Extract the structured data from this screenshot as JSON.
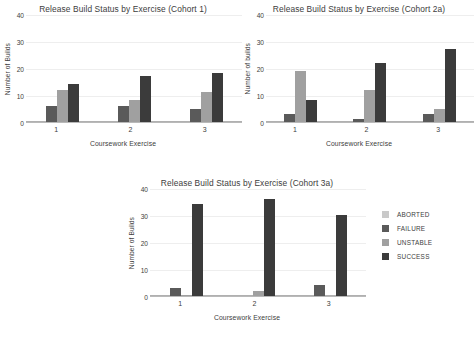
{
  "legend": {
    "items": [
      {
        "label": "ABORTED",
        "color": "#c9c9c9"
      },
      {
        "label": "FAILURE",
        "color": "#5a5a5a"
      },
      {
        "label": "UNSTABLE",
        "color": "#a0a0a0"
      },
      {
        "label": "SUCCESS",
        "color": "#3b3b3b"
      }
    ]
  },
  "chart_data": [
    {
      "type": "bar",
      "title": "Release Build Status by Exercise (Cohort 1)",
      "xlabel": "Coursework Exercise",
      "ylabel": "Number of Builds",
      "categories": [
        "1",
        "2",
        "3"
      ],
      "ylim": [
        0,
        40
      ],
      "yticks": [
        0,
        10,
        20,
        30,
        40
      ],
      "grid": true,
      "legend_position": "right-shared",
      "series": [
        {
          "name": "FAILURE",
          "color": "#5a5a5a",
          "values": [
            6,
            6,
            5
          ]
        },
        {
          "name": "UNSTABLE",
          "color": "#a0a0a0",
          "values": [
            12,
            8,
            11
          ]
        },
        {
          "name": "SUCCESS",
          "color": "#3b3b3b",
          "values": [
            14,
            17,
            18
          ]
        }
      ]
    },
    {
      "type": "bar",
      "title": "Release Build Status by Exercise (Cohort 2a)",
      "xlabel": "Coursework Exercise",
      "ylabel": "Number of builds",
      "categories": [
        "1",
        "2",
        "3"
      ],
      "ylim": [
        0,
        40
      ],
      "yticks": [
        0,
        10,
        20,
        30,
        40
      ],
      "grid": true,
      "legend_position": "right-shared",
      "series": [
        {
          "name": "FAILURE",
          "color": "#5a5a5a",
          "values": [
            3,
            1,
            3
          ]
        },
        {
          "name": "UNSTABLE",
          "color": "#a0a0a0",
          "values": [
            19,
            12,
            5
          ]
        },
        {
          "name": "SUCCESS",
          "color": "#3b3b3b",
          "values": [
            8,
            22,
            27
          ]
        }
      ]
    },
    {
      "type": "bar",
      "title": "Release Build Status by Exercise (Cohort 3a)",
      "xlabel": "Coursework Exercise",
      "ylabel": "Number of Builds",
      "categories": [
        "1",
        "2",
        "3"
      ],
      "ylim": [
        0,
        40
      ],
      "yticks": [
        0,
        10,
        20,
        30,
        40
      ],
      "grid": true,
      "legend_position": "right-shared",
      "series": [
        {
          "name": "FAILURE",
          "color": "#5a5a5a",
          "values": [
            3,
            0,
            4
          ]
        },
        {
          "name": "UNSTABLE",
          "color": "#a0a0a0",
          "values": [
            0.5,
            2,
            0
          ]
        },
        {
          "name": "SUCCESS",
          "color": "#3b3b3b",
          "values": [
            34,
            36,
            30
          ]
        }
      ]
    }
  ]
}
